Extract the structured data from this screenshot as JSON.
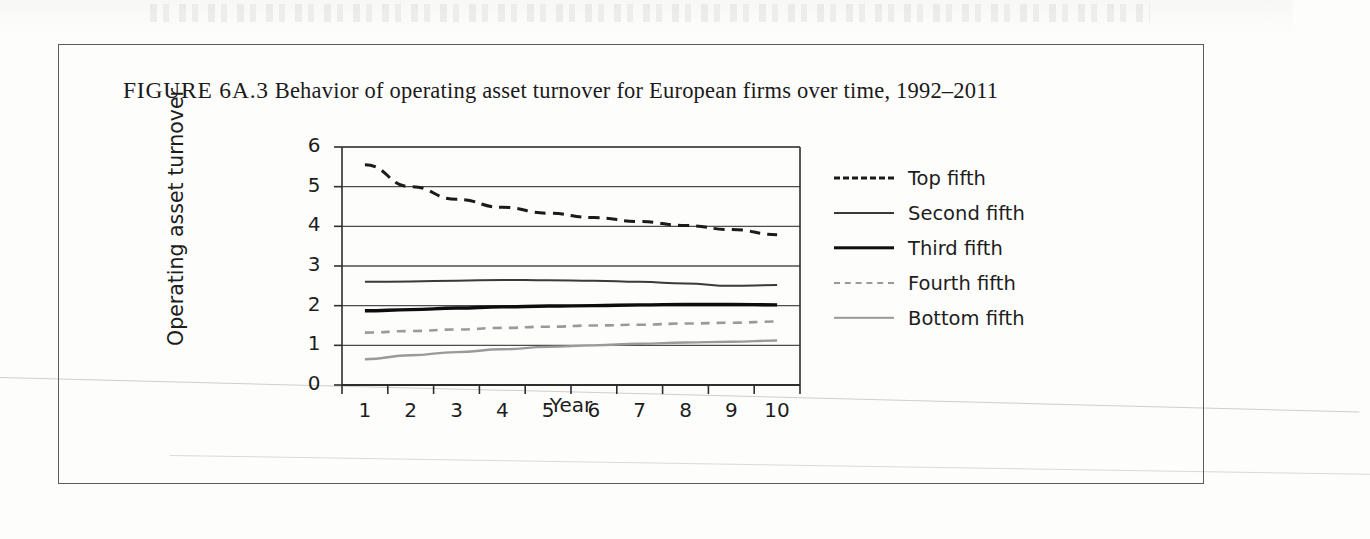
{
  "page": {
    "figure_label": "FIGURE 6A.3",
    "title": "Behavior of operating asset turnover for European firms over time, 1992–2011"
  },
  "chart_data": {
    "type": "line",
    "title": "Behavior of operating asset turnover for European firms over time, 1992–2011",
    "xlabel": "Year",
    "ylabel": "Operating asset turnover",
    "x": [
      1,
      2,
      3,
      4,
      5,
      6,
      7,
      8,
      9,
      10
    ],
    "xtick_labels": [
      "1",
      "2",
      "3",
      "4",
      "5",
      "6",
      "7",
      "8",
      "9",
      "10"
    ],
    "ytick_labels": [
      "0",
      "1",
      "2",
      "3",
      "4",
      "5",
      "6"
    ],
    "xlim": [
      0.5,
      10.5
    ],
    "ylim": [
      0,
      6
    ],
    "grid": "horizontal",
    "legend_position": "right",
    "series": [
      {
        "name": "Top fifth",
        "style": "dashed",
        "color": "#1b1b1b",
        "width": 3.0,
        "values": [
          5.55,
          5.0,
          4.68,
          4.48,
          4.33,
          4.22,
          4.12,
          4.02,
          3.92,
          3.79
        ]
      },
      {
        "name": "Second fifth",
        "style": "solid",
        "color": "#3a3a3a",
        "width": 2.0,
        "values": [
          2.6,
          2.61,
          2.63,
          2.65,
          2.64,
          2.63,
          2.6,
          2.56,
          2.5,
          2.52
        ]
      },
      {
        "name": "Third fifth",
        "style": "solid",
        "color": "#0d0d0d",
        "width": 3.4,
        "values": [
          1.87,
          1.9,
          1.94,
          1.97,
          1.99,
          2.0,
          2.02,
          2.03,
          2.03,
          2.02
        ]
      },
      {
        "name": "Fourth fifth",
        "style": "dashed",
        "color": "#9a9a9a",
        "width": 2.6,
        "values": [
          1.32,
          1.36,
          1.4,
          1.44,
          1.47,
          1.5,
          1.52,
          1.55,
          1.57,
          1.6
        ]
      },
      {
        "name": "Bottom fifth",
        "style": "solid",
        "color": "#9a9a9a",
        "width": 2.4,
        "values": [
          0.65,
          0.75,
          0.83,
          0.9,
          0.96,
          1.0,
          1.04,
          1.07,
          1.09,
          1.12
        ]
      }
    ]
  }
}
